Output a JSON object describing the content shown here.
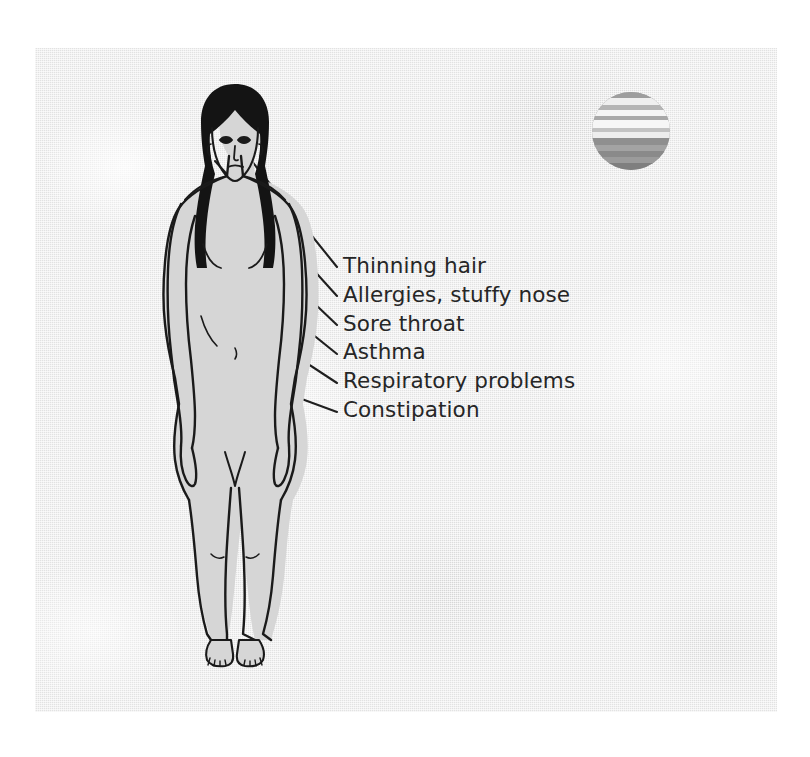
{
  "figure": {
    "background_color": "#e2e2e2",
    "page_color": "#ffffff",
    "ink_color": "#1a1a1a",
    "text_color": "#262626"
  },
  "labels": [
    {
      "id": "thinning-hair",
      "text": "Thinning hair"
    },
    {
      "id": "allergies-stuffy-nose",
      "text": "Allergies, stuffy nose"
    },
    {
      "id": "sore-throat",
      "text": "Sore throat"
    },
    {
      "id": "asthma",
      "text": "Asthma"
    },
    {
      "id": "respiratory-problems",
      "text": "Respiratory problems"
    },
    {
      "id": "constipation",
      "text": "Constipation"
    }
  ],
  "sphere": {
    "name": "planet-sphere",
    "description": "banded grayscale sphere",
    "light_band_color": "#f2f2f2",
    "dark_band_color": "#8a8a8a"
  }
}
